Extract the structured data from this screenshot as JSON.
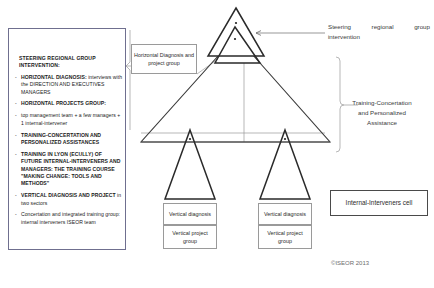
{
  "diagram": {
    "copyright": "©ISEOR 2013",
    "colors": {
      "line": "#3a3a3a",
      "thin_line": "#9a9a9a",
      "panel_border": "#6f6f8f",
      "background": "#ffffff"
    }
  },
  "left_panel": {
    "heading": "STEERING REGIONAL GROUP INTERVENTION:",
    "items": [
      {
        "strong": "HORIZONTAL DIAGNOSIS:",
        "text": "interviews with the DIRECTION AND EXECUTIVES MANAGERS"
      },
      {
        "strong": "HORIZONTAL PROJECTS GROUP:",
        "text": ""
      },
      {
        "strong": "",
        "text": "top management team + a few managers + 1 internal-intervener"
      },
      {
        "strong": "TRAINING-CONCERTATION and PERSONALIZED ASSISTANCES",
        "text": ""
      },
      {
        "strong": "TRAINING IN LYON (ECULLY) OF FUTURE INTERNAL-INTERVENERS AND MANAGERS: THE TRAINING COURSE \"MAKING CHANGE: TOOLS AND METHODS\"",
        "text": ""
      },
      {
        "strong": "VERTICAL DIAGNOSIS AND PROJECT",
        "text": "in two sectors"
      },
      {
        "strong": "",
        "text": "Concertation and integrated training group: internal interveners ISEOR team"
      }
    ]
  },
  "labels": {
    "horizontal_group": "Horizontal Diagnosis and project group",
    "vertical_diagnosis_1": "Vertical diagnosis",
    "vertical_project_group_1": "Vertical project group",
    "vertical_diagnosis_2": "Vertical diagnosis",
    "vertical_project_group_2": "Vertical project group",
    "internal_interveners_cell": "Internal-Interveners cell"
  },
  "annotations": {
    "steering_line1_word1": "Steering",
    "steering_line1_word2": "regional",
    "steering_line1_word3": "group",
    "steering_line2": "intervention",
    "training": "Training-Concertation and Personalized Assistance"
  },
  "shapes": {
    "big_triangle": "large pyramid representing the organization",
    "top_small_triangle": "steering group apex",
    "second_small_triangle": "horizontal diagnosis and project group",
    "left_small_triangle": "vertical sector 1",
    "right_small_triangle": "vertical sector 2"
  }
}
